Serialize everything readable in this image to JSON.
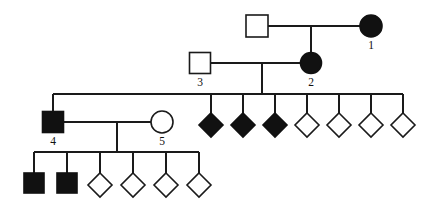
{
  "chart_data": {
    "type": "diagram",
    "subtype": "pedigree",
    "canvas": {
      "width": 430,
      "height": 212,
      "background": "#ffffff"
    },
    "style": {
      "line_color": "#1a1a1a",
      "line_width": 1.3,
      "symbol_stroke": "#1a1a1a",
      "affected_fill": "#111111",
      "unaffected_fill": "#ffffff",
      "label_color": "#111111"
    },
    "legend": {
      "square": "male",
      "circle": "female",
      "diamond": "unspecified sex",
      "filled": "affected",
      "open": "unaffected"
    },
    "generations": [
      {
        "id": "I",
        "individuals": [
          {
            "id": "I-1",
            "shape": "square",
            "status": "open",
            "sex": "male",
            "affected": false,
            "label": "",
            "cx": 257,
            "cy": 26,
            "size": 22
          },
          {
            "id": "I-2",
            "shape": "circle",
            "status": "filled",
            "sex": "female",
            "affected": true,
            "label": "1",
            "cx": 371,
            "cy": 26,
            "size": 22
          }
        ]
      },
      {
        "id": "II",
        "individuals": [
          {
            "id": "II-1",
            "shape": "square",
            "status": "open",
            "sex": "male",
            "affected": false,
            "label": "3",
            "cx": 200,
            "cy": 63,
            "size": 21
          },
          {
            "id": "II-2",
            "shape": "circle",
            "status": "filled",
            "sex": "female",
            "affected": true,
            "label": "2",
            "cx": 311,
            "cy": 63,
            "size": 21
          }
        ]
      },
      {
        "id": "III",
        "individuals": [
          {
            "id": "III-1",
            "shape": "square",
            "status": "filled",
            "sex": "male",
            "affected": true,
            "label": "4",
            "cx": 53,
            "cy": 122,
            "size": 21
          },
          {
            "id": "III-2",
            "shape": "circle",
            "status": "open",
            "sex": "female",
            "affected": false,
            "label": "5",
            "cx": 162,
            "cy": 122,
            "size": 22
          },
          {
            "id": "III-3",
            "shape": "diamond",
            "status": "filled",
            "sex": "unspecified",
            "affected": true,
            "label": "",
            "cx": 211,
            "cy": 125,
            "size": 24
          },
          {
            "id": "III-4",
            "shape": "diamond",
            "status": "filled",
            "sex": "unspecified",
            "affected": true,
            "label": "",
            "cx": 243,
            "cy": 125,
            "size": 24
          },
          {
            "id": "III-5",
            "shape": "diamond",
            "status": "filled",
            "sex": "unspecified",
            "affected": true,
            "label": "",
            "cx": 275,
            "cy": 125,
            "size": 24
          },
          {
            "id": "III-6",
            "shape": "diamond",
            "status": "open",
            "sex": "unspecified",
            "affected": false,
            "label": "",
            "cx": 307,
            "cy": 125,
            "size": 24
          },
          {
            "id": "III-7",
            "shape": "diamond",
            "status": "open",
            "sex": "unspecified",
            "affected": false,
            "label": "",
            "cx": 339,
            "cy": 125,
            "size": 24
          },
          {
            "id": "III-8",
            "shape": "diamond",
            "status": "open",
            "sex": "unspecified",
            "affected": false,
            "label": "",
            "cx": 371,
            "cy": 125,
            "size": 24
          },
          {
            "id": "III-9",
            "shape": "diamond",
            "status": "open",
            "sex": "unspecified",
            "affected": false,
            "label": "",
            "cx": 403,
            "cy": 125,
            "size": 24
          }
        ]
      },
      {
        "id": "IV",
        "individuals": [
          {
            "id": "IV-1",
            "shape": "square",
            "status": "filled",
            "sex": "male",
            "affected": true,
            "label": "",
            "cx": 34,
            "cy": 183,
            "size": 20
          },
          {
            "id": "IV-2",
            "shape": "square",
            "status": "filled",
            "sex": "male",
            "affected": true,
            "label": "",
            "cx": 67,
            "cy": 183,
            "size": 20
          },
          {
            "id": "IV-3",
            "shape": "diamond",
            "status": "open",
            "sex": "unspecified",
            "affected": false,
            "label": "",
            "cx": 100,
            "cy": 185,
            "size": 24
          },
          {
            "id": "IV-4",
            "shape": "diamond",
            "status": "open",
            "sex": "unspecified",
            "affected": false,
            "label": "",
            "cx": 133,
            "cy": 185,
            "size": 24
          },
          {
            "id": "IV-5",
            "shape": "diamond",
            "status": "open",
            "sex": "unspecified",
            "affected": false,
            "label": "",
            "cx": 166,
            "cy": 185,
            "size": 24
          },
          {
            "id": "IV-6",
            "shape": "diamond",
            "status": "open",
            "sex": "unspecified",
            "affected": false,
            "label": "",
            "cx": 199,
            "cy": 185,
            "size": 24
          }
        ]
      }
    ],
    "matings": [
      {
        "id": "mating-1",
        "partners": [
          "I-1",
          "I-2"
        ],
        "line_y": 26,
        "x_from": 268,
        "x_to": 360,
        "descent_x": 311,
        "descent_to_y": 52
      },
      {
        "id": "mating-2",
        "partners": [
          "II-1",
          "II-2"
        ],
        "line_y": 63,
        "x_from": 211,
        "x_to": 300,
        "descent_x": 262,
        "descent_to_y": 94
      },
      {
        "id": "mating-3",
        "partners": [
          "III-1",
          "III-2"
        ],
        "line_y": 122,
        "x_from": 64,
        "x_to": 151,
        "descent_x": 117,
        "descent_to_y": 152
      }
    ],
    "sibships": [
      {
        "id": "sibship-generation-III",
        "bar_y": 94,
        "x_from": 53,
        "x_to": 403,
        "children": [
          "III-1",
          "III-3",
          "III-4",
          "III-5",
          "III-6",
          "III-7",
          "III-8",
          "III-9"
        ],
        "drop_x": [
          53,
          211,
          243,
          275,
          307,
          339,
          371,
          403
        ]
      },
      {
        "id": "sibship-generation-IV",
        "bar_y": 152,
        "x_from": 34,
        "x_to": 199,
        "children": [
          "IV-1",
          "IV-2",
          "IV-3",
          "IV-4",
          "IV-5",
          "IV-6"
        ],
        "drop_x": [
          34,
          67,
          100,
          133,
          166,
          199
        ]
      }
    ],
    "labels": [
      {
        "id": "label-1",
        "text": "1",
        "x": 371,
        "y": 49,
        "for": "I-2"
      },
      {
        "id": "label-2",
        "text": "2",
        "x": 311,
        "y": 86,
        "for": "II-2"
      },
      {
        "id": "label-3",
        "text": "3",
        "x": 200,
        "y": 86,
        "for": "II-1"
      },
      {
        "id": "label-4",
        "text": "4",
        "x": 53,
        "y": 145,
        "for": "III-1"
      },
      {
        "id": "label-5",
        "text": "5",
        "x": 162,
        "y": 145,
        "for": "III-2"
      }
    ]
  }
}
